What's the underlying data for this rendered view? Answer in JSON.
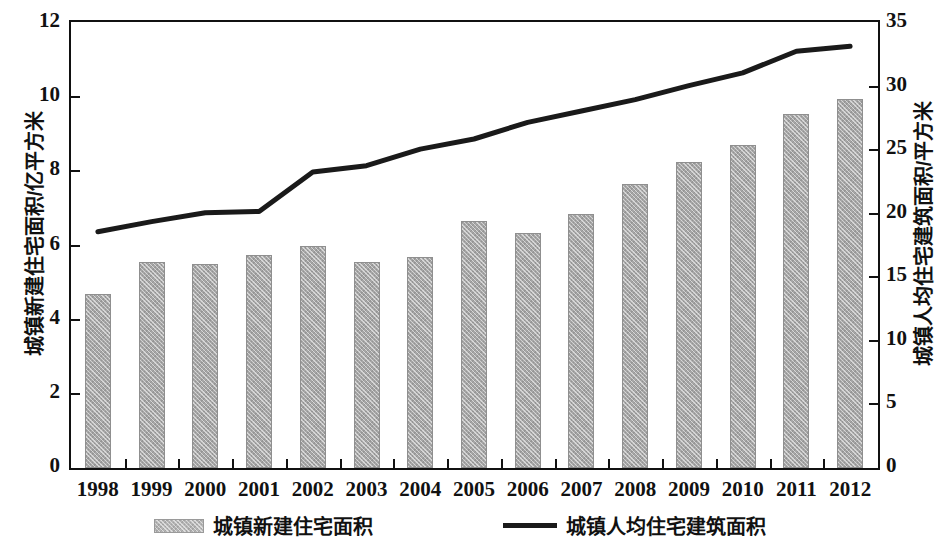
{
  "chart_data": {
    "type": "bar",
    "title": "",
    "subtitle": "",
    "xlabel": "",
    "ylabel": "城镇新建住宅面积/亿平方米",
    "y2label": "城镇人均住宅建筑面积/平方米",
    "categories": [
      "1998",
      "1999",
      "2000",
      "2001",
      "2002",
      "2003",
      "2004",
      "2005",
      "2006",
      "2007",
      "2008",
      "2009",
      "2010",
      "2011",
      "2012"
    ],
    "ylim": [
      0,
      12
    ],
    "y2lim": [
      0,
      35
    ],
    "yticks": [
      "0",
      "2",
      "4",
      "6",
      "8",
      "10",
      "12"
    ],
    "y2ticks": [
      "0",
      "5",
      "10",
      "15",
      "20",
      "25",
      "30",
      "35"
    ],
    "ytick_values": [
      0,
      2,
      4,
      6,
      8,
      10,
      12
    ],
    "y2tick_values": [
      0,
      5,
      10,
      15,
      20,
      25,
      30,
      35
    ],
    "grid": false,
    "legend_position": "bottom",
    "series": [
      {
        "name": "城镇新建住宅面积",
        "type": "bar",
        "axis": "left",
        "unit": "亿平方米",
        "color": "#a6a6a6",
        "values": [
          4.7,
          5.55,
          5.5,
          5.75,
          6.0,
          5.55,
          5.7,
          6.65,
          6.35,
          6.85,
          7.65,
          8.25,
          8.7,
          9.55,
          9.95
        ]
      },
      {
        "name": "城镇人均住宅建筑面积",
        "type": "line",
        "axis": "right",
        "unit": "平方米",
        "color": "#1a1a1a",
        "values": [
          18.5,
          19.3,
          20.0,
          20.1,
          23.2,
          23.7,
          25.0,
          25.8,
          27.1,
          28.0,
          28.9,
          30.0,
          31.0,
          32.7,
          33.1
        ]
      }
    ]
  },
  "legend": {
    "items": [
      {
        "label": "城镇新建住宅面积",
        "marker": "bar-swatch"
      },
      {
        "label": "城镇人均住宅建筑面积",
        "marker": "line-swatch"
      }
    ]
  }
}
